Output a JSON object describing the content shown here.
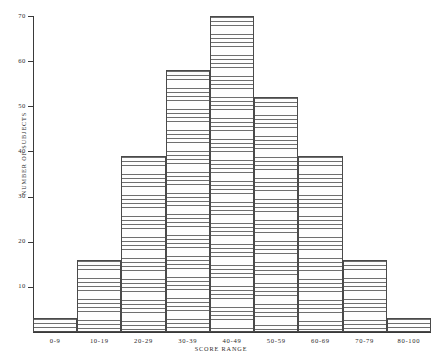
{
  "chart_data": {
    "type": "bar",
    "title": "",
    "subtitle": "",
    "xlabel": "SCORE RANGE",
    "ylabel": "NUMBER OF SUBJECTS",
    "categories": [
      "0-9",
      "10-19",
      "20-29",
      "30-39",
      "40-49",
      "50-59",
      "60-69",
      "70-79",
      "80-100"
    ],
    "values": [
      3,
      16,
      39,
      58,
      70,
      52,
      39,
      16,
      3
    ],
    "ylim": [
      0,
      70
    ],
    "yticks": [
      10,
      20,
      30,
      40,
      50,
      60,
      70
    ],
    "ytick_labels": [
      "10",
      "20",
      "30",
      "40",
      "50",
      "60",
      "70"
    ],
    "grid": false,
    "legend": null,
    "bar_fill": "hatched-horizontal-lines",
    "bar_edge_color": "#4a4a4a",
    "hatch_color": "#6e6e6e",
    "background": "#ffffff",
    "annotations": []
  }
}
